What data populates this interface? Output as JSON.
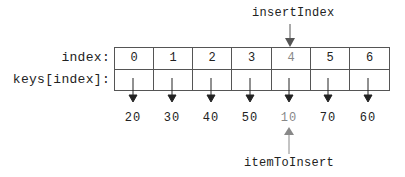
{
  "diagram": {
    "top_pointer": {
      "label": "insertIndex",
      "target_index": 4,
      "color": "#555555"
    },
    "bottom_pointer": {
      "label": "itemToInsert",
      "target_index": 4,
      "color": "#777777"
    },
    "row_labels": {
      "index": "index:",
      "keys": "keys[index]:"
    },
    "indices": [
      "0",
      "1",
      "2",
      "3",
      "4",
      "5",
      "6"
    ],
    "values": [
      "20",
      "30",
      "40",
      "50",
      "10",
      "70",
      "60"
    ],
    "highlight_index": 4,
    "colors": {
      "normal": "#222222",
      "highlight": "#888888",
      "grid": "#555555"
    }
  }
}
